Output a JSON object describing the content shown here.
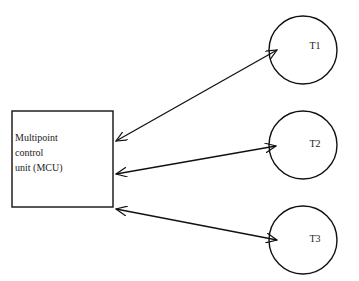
{
  "diagram": {
    "mcu": {
      "lines": [
        "Multipoint",
        "control",
        "unit (MCU)"
      ]
    },
    "terminals": [
      {
        "label": "T1"
      },
      {
        "label": "T2"
      },
      {
        "label": "T3"
      }
    ],
    "connections": [
      {
        "from": "MCU",
        "to": "T1",
        "type": "bidirectional"
      },
      {
        "from": "MCU",
        "to": "T2",
        "type": "bidirectional"
      },
      {
        "from": "MCU",
        "to": "T3",
        "type": "bidirectional"
      }
    ]
  }
}
